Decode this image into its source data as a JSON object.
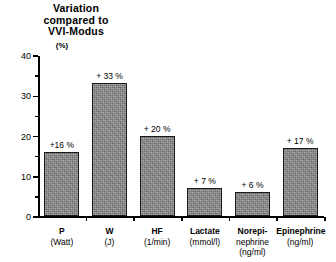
{
  "chart": {
    "title_lines": [
      "Variation",
      "compared to",
      "VVI-Modus"
    ],
    "unit_label": "(%)"
  },
  "chart_data": {
    "type": "bar",
    "title": "Variation compared to VVI-Modus (%)",
    "xlabel": "",
    "ylabel": "(%)",
    "ylim": [
      0,
      40
    ],
    "yticks": [
      0,
      10,
      20,
      30,
      40
    ],
    "ytick_labels": [
      "0",
      "10",
      "20",
      "30",
      "40"
    ],
    "yminor_ticks": [
      5,
      15,
      25,
      35
    ],
    "grid": false,
    "legend": null,
    "categories": [
      "P",
      "W",
      "HF",
      "Lactate",
      "Norepinephrine",
      "Epinephrine"
    ],
    "category_units": [
      "(Watt)",
      "(J)",
      "(1/min)",
      "(mmol/l)",
      "(ng/ml)",
      "(ng/ml)"
    ],
    "category_label_lines": [
      [
        "P",
        "(Watt)"
      ],
      [
        "W",
        "(J)"
      ],
      [
        "HF",
        "(1/min)"
      ],
      [
        "Lactate",
        "(mmol/l)"
      ],
      [
        "Norepi-",
        "nephrine",
        "(ng/ml)"
      ],
      [
        "Epinephrine",
        "(ng/ml)"
      ]
    ],
    "values": [
      16,
      33,
      20,
      7,
      6,
      17
    ],
    "data_labels": [
      "+16 %",
      "+ 33 %",
      "+ 20 %",
      "+ 7 %",
      "+ 6 %",
      "+ 17 %"
    ],
    "bar_color": "#8a8a8a",
    "bar_edge_color": "#1a1a1a",
    "axis_color": "#000000",
    "background": "#ffffff"
  }
}
